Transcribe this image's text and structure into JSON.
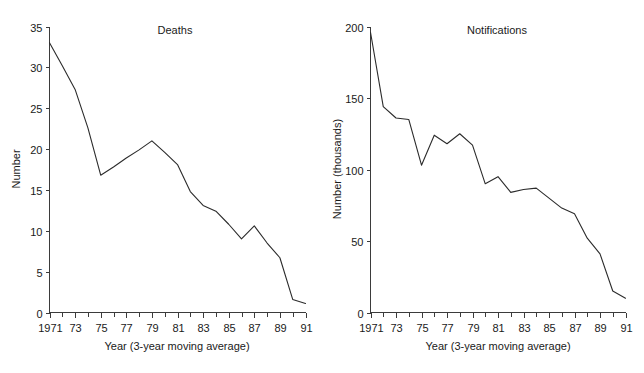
{
  "figure": {
    "background_color": "#ffffff",
    "line_color": "#2b2b2b",
    "axis_color": "#3b3b3b"
  },
  "chart_data": [
    {
      "type": "line",
      "title": "Deaths",
      "xlabel": "Year (3-year moving average)",
      "ylabel": "Number",
      "xlim": [
        1971,
        1991
      ],
      "ylim": [
        0,
        35
      ],
      "grid": false,
      "legend": "none",
      "y_ticks": [
        0,
        5,
        10,
        15,
        20,
        25,
        30,
        35
      ],
      "y_tick_labels": [
        "0",
        "5",
        "10",
        "15",
        "20",
        "25",
        "30",
        "35"
      ],
      "x_ticks": [
        1971,
        1973,
        1975,
        1977,
        1979,
        1981,
        1983,
        1985,
        1987,
        1989,
        1991
      ],
      "x_tick_labels": [
        "1971",
        "73",
        "75",
        "77",
        "79",
        "81",
        "83",
        "85",
        "87",
        "89",
        "91"
      ],
      "x_minor_ticks": [
        1972,
        1974,
        1976,
        1978,
        1980,
        1982,
        1984,
        1986,
        1988,
        1990
      ],
      "x": [
        1971,
        1972,
        1973,
        1974,
        1975,
        1976,
        1977,
        1978,
        1979,
        1980,
        1981,
        1982,
        1983,
        1984,
        1985,
        1986,
        1987,
        1988,
        1989,
        1990,
        1991
      ],
      "values": [
        33.0,
        30.2,
        27.3,
        22.6,
        16.8,
        17.8,
        18.9,
        19.9,
        21.0,
        19.6,
        18.1,
        14.8,
        13.1,
        12.4,
        10.8,
        9.0,
        10.6,
        8.5,
        6.7,
        1.6,
        1.1
      ]
    },
    {
      "type": "line",
      "title": "Notifications",
      "xlabel": "Year (3-year moving average)",
      "ylabel": "Number (thousands)",
      "xlim": [
        1971,
        1991
      ],
      "ylim": [
        0,
        200
      ],
      "grid": false,
      "legend": "none",
      "y_ticks": [
        0,
        50,
        100,
        150,
        200
      ],
      "y_tick_labels": [
        "0",
        "50",
        "100",
        "150",
        "200"
      ],
      "x_ticks": [
        1971,
        1973,
        1975,
        1977,
        1979,
        1981,
        1983,
        1985,
        1987,
        1989,
        1991
      ],
      "x_tick_labels": [
        "1971",
        "73",
        "75",
        "77",
        "79",
        "81",
        "83",
        "85",
        "87",
        "89",
        "91"
      ],
      "x_minor_ticks": [
        1972,
        1974,
        1976,
        1978,
        1980,
        1982,
        1984,
        1986,
        1988,
        1990
      ],
      "x": [
        1971,
        1972,
        1973,
        1974,
        1975,
        1976,
        1977,
        1978,
        1979,
        1980,
        1981,
        1982,
        1983,
        1984,
        1985,
        1986,
        1987,
        1988,
        1989,
        1990,
        1991
      ],
      "values": [
        196,
        144,
        136,
        135,
        103,
        124,
        118,
        125,
        117,
        90,
        95,
        84,
        86,
        87,
        80,
        73,
        69,
        52,
        41,
        15,
        10
      ]
    }
  ]
}
